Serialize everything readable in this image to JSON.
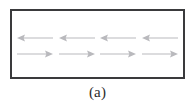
{
  "figure": {
    "caption": "(a)",
    "panel_label": "a",
    "type": "vector-field-schematic",
    "border_color": "#3a3a3c",
    "background_color": "#ffffff",
    "arrow_color": "#b9b9bd",
    "box": {
      "x": 10,
      "y": 9,
      "width": 175,
      "height": 70,
      "border_width": 2
    },
    "rows": [
      {
        "id": "top-row",
        "direction": "left",
        "count": 4,
        "arrow_label": "leftward-arrow",
        "arrows": [
          {
            "direction": "left"
          },
          {
            "direction": "left"
          },
          {
            "direction": "left"
          },
          {
            "direction": "left"
          }
        ]
      },
      {
        "id": "bottom-row",
        "direction": "right",
        "count": 4,
        "arrow_label": "rightward-arrow",
        "arrows": [
          {
            "direction": "right"
          },
          {
            "direction": "right"
          },
          {
            "direction": "right"
          },
          {
            "direction": "right"
          }
        ]
      }
    ]
  }
}
